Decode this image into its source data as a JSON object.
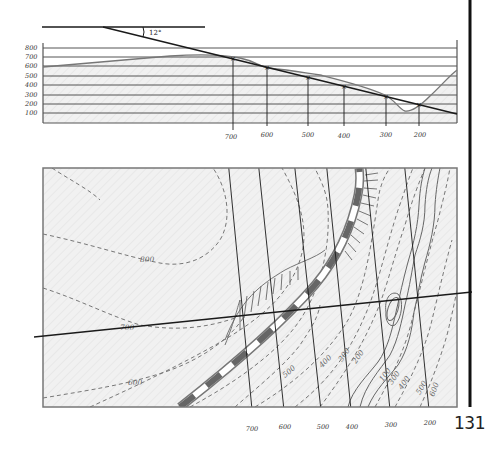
{
  "figure": {
    "page_number": "131",
    "dip_angle_label": "12°",
    "colors": {
      "ink": "#1a1a1a",
      "grid": "#555555",
      "fill": "#eeeeee",
      "contour": "#777777",
      "railway": "#666666"
    },
    "profile": {
      "y_axis_labels": [
        "800",
        "700",
        "600",
        "500",
        "400",
        "300",
        "200",
        "100"
      ],
      "intersection_labels": [
        "700",
        "600",
        "500",
        "400",
        "300",
        "200"
      ]
    },
    "map": {
      "contour_labels": [
        "800",
        "700",
        "600",
        "500",
        "400",
        "300",
        "200",
        "100",
        "300",
        "400",
        "500",
        "600"
      ],
      "strike_line_labels": [
        "700",
        "600",
        "500",
        "400",
        "300",
        "200"
      ]
    }
  }
}
